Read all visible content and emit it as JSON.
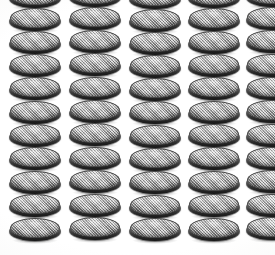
{
  "scene": {
    "title": "Coin cell battery array",
    "description": "Overhead-angled photograph of stacked lithium coin cell batteries arranged in vertical columns",
    "width": 275,
    "height": 255,
    "background_color": "#fdfdfd",
    "object_name": "coin-cell-battery",
    "object_count_total": 55,
    "columns_count": 5,
    "rows_count": 11
  },
  "palette": {
    "background": "#fdfdfd",
    "cell_face_light": "#c2c2c2",
    "cell_face_mid": "#a9a9a9",
    "cell_face_dark": "#8b8b8b",
    "cell_rim_light": "#8d8d8d",
    "cell_rim_dark": "#303030",
    "cell_outline": "#4a4a4a"
  },
  "geometry": {
    "cell_width": 54,
    "cell_height": 26,
    "face_width": 50,
    "face_height": 20,
    "column_pitch": 60,
    "row_pitch": 23.2,
    "first_column_x": 8,
    "first_row_y": -16
  },
  "columns": [
    {
      "index": 0,
      "label": "column-1",
      "x": 8,
      "cells": [
        {
          "row": 0,
          "y": -16
        },
        {
          "row": 1,
          "y": 7
        },
        {
          "row": 2,
          "y": 30
        },
        {
          "row": 3,
          "y": 53
        },
        {
          "row": 4,
          "y": 76
        },
        {
          "row": 5,
          "y": 100
        },
        {
          "row": 6,
          "y": 123
        },
        {
          "row": 7,
          "y": 146
        },
        {
          "row": 8,
          "y": 170
        },
        {
          "row": 9,
          "y": 193
        },
        {
          "row": 10,
          "y": 217
        }
      ]
    },
    {
      "index": 1,
      "label": "column-2",
      "x": 68,
      "cells": [
        {
          "row": 0,
          "y": -17
        },
        {
          "row": 1,
          "y": 6
        },
        {
          "row": 2,
          "y": 29
        },
        {
          "row": 3,
          "y": 52
        },
        {
          "row": 4,
          "y": 76
        },
        {
          "row": 5,
          "y": 99
        },
        {
          "row": 6,
          "y": 122
        },
        {
          "row": 7,
          "y": 146
        },
        {
          "row": 8,
          "y": 169
        },
        {
          "row": 9,
          "y": 193
        },
        {
          "row": 10,
          "y": 216
        }
      ]
    },
    {
      "index": 2,
      "label": "column-3",
      "x": 128,
      "cells": [
        {
          "row": 0,
          "y": -15
        },
        {
          "row": 1,
          "y": 8
        },
        {
          "row": 2,
          "y": 31
        },
        {
          "row": 3,
          "y": 54
        },
        {
          "row": 4,
          "y": 77
        },
        {
          "row": 5,
          "y": 100
        },
        {
          "row": 6,
          "y": 124
        },
        {
          "row": 7,
          "y": 147
        },
        {
          "row": 8,
          "y": 170
        },
        {
          "row": 9,
          "y": 194
        },
        {
          "row": 10,
          "y": 217
        }
      ]
    },
    {
      "index": 3,
      "label": "column-4",
      "x": 187,
      "cells": [
        {
          "row": 0,
          "y": -16
        },
        {
          "row": 1,
          "y": 7
        },
        {
          "row": 2,
          "y": 30
        },
        {
          "row": 3,
          "y": 53
        },
        {
          "row": 4,
          "y": 76
        },
        {
          "row": 5,
          "y": 100
        },
        {
          "row": 6,
          "y": 123
        },
        {
          "row": 7,
          "y": 146
        },
        {
          "row": 8,
          "y": 170
        },
        {
          "row": 9,
          "y": 193
        },
        {
          "row": 10,
          "y": 217
        }
      ]
    },
    {
      "index": 4,
      "label": "column-5",
      "x": 245,
      "cells": [
        {
          "row": 0,
          "y": -17
        },
        {
          "row": 1,
          "y": 6
        },
        {
          "row": 2,
          "y": 29
        },
        {
          "row": 3,
          "y": 53
        },
        {
          "row": 4,
          "y": 76
        },
        {
          "row": 5,
          "y": 99
        },
        {
          "row": 6,
          "y": 123
        },
        {
          "row": 7,
          "y": 146
        },
        {
          "row": 8,
          "y": 169
        },
        {
          "row": 9,
          "y": 193
        },
        {
          "row": 10,
          "y": 216
        }
      ]
    }
  ]
}
